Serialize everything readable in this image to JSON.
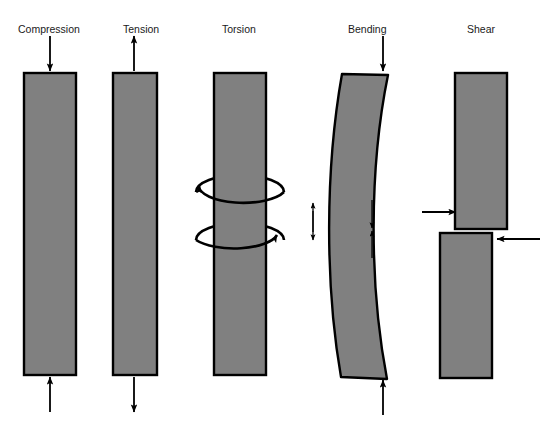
{
  "figure": {
    "background_color": "#ffffff",
    "member_fill_color": "#808080",
    "member_stroke_color": "#000000",
    "arrow_color": "#000000",
    "label_color": "#1a1a1a"
  },
  "labels": {
    "compression": "Compression",
    "tension": "Tension",
    "torsion": "Torsion",
    "bending": "Bending",
    "shear": "Shear"
  },
  "panels": [
    {
      "id": "compression",
      "label": "Compression",
      "label_x": 18,
      "label_y": 33,
      "load_description": "Two collinear arrows pointing toward the bar from top and bottom",
      "arrows": [
        {
          "name": "top-arrow",
          "direction": "down",
          "x": 50,
          "y1": 36,
          "y2": 71
        },
        {
          "name": "bottom-arrow",
          "direction": "up",
          "x": 50,
          "y1": 412,
          "y2": 377
        }
      ],
      "member": {
        "shape": "rectangle",
        "x": 24,
        "y": 73,
        "width": 52,
        "height": 302
      }
    },
    {
      "id": "tension",
      "label": "Tension",
      "label_x": 123,
      "label_y": 33,
      "load_description": "Two collinear arrows pointing away from the bar at top and bottom",
      "arrows": [
        {
          "name": "top-arrow",
          "direction": "up",
          "x": 134,
          "y1": 71,
          "y2": 36
        },
        {
          "name": "bottom-arrow",
          "direction": "down",
          "x": 134,
          "y1": 377,
          "y2": 412
        }
      ],
      "member": {
        "shape": "rectangle",
        "x": 113,
        "y": 73,
        "width": 44,
        "height": 302
      }
    },
    {
      "id": "torsion",
      "label": "Torsion",
      "label_x": 222,
      "label_y": 33,
      "load_description": "Two elliptical curved arrows encircling the bar in opposite rotational senses",
      "arrows": [
        {
          "name": "upper-twist-arrow",
          "type": "curved-ellipse",
          "cx": 240,
          "cy": 192,
          "rx": 45,
          "ry": 17,
          "arrowhead": "upper-left"
        },
        {
          "name": "lower-twist-arrow",
          "type": "curved-ellipse",
          "cx": 240,
          "cy": 240,
          "rx": 45,
          "ry": 17,
          "arrowhead": "right"
        }
      ],
      "member": {
        "shape": "rectangle",
        "x": 214,
        "y": 73,
        "width": 52,
        "height": 302
      }
    },
    {
      "id": "bending",
      "label": "Bending",
      "label_x": 348,
      "label_y": 33,
      "load_description": "Curved beam bowed to the left with end loads and internal compression/tension arrow pairs",
      "arrows": [
        {
          "name": "top-arrow",
          "direction": "down",
          "x": 383,
          "y1": 36,
          "y2": 71
        },
        {
          "name": "bottom-arrow",
          "direction": "up",
          "x": 383,
          "y1": 415,
          "y2": 380
        },
        {
          "name": "left-upper-arrow",
          "direction": "up",
          "x": 313,
          "y1": 232,
          "y2": 202
        },
        {
          "name": "left-lower-arrow",
          "direction": "down",
          "x": 313,
          "y1": 210,
          "y2": 240
        },
        {
          "name": "right-upper-arrow",
          "direction": "down",
          "x": 372,
          "y1": 200,
          "y2": 228
        },
        {
          "name": "right-lower-arrow",
          "direction": "up",
          "x": 372,
          "y1": 258,
          "y2": 230
        }
      ],
      "member": {
        "shape": "curved-beam",
        "bow": "left",
        "top_y": 73,
        "bottom_y": 378
      }
    },
    {
      "id": "shear",
      "label": "Shear",
      "label_x": 467,
      "label_y": 33,
      "load_description": "Two offset blocks pushed in opposite horizontal directions along the split plane",
      "arrows": [
        {
          "name": "upper-left-arrow",
          "direction": "right",
          "y": 212,
          "x1": 422,
          "x2": 456
        },
        {
          "name": "lower-right-arrow",
          "direction": "left",
          "y": 239,
          "x1": 540,
          "x2": 497
        }
      ],
      "member": {
        "shape": "split-blocks",
        "upper_block": {
          "x": 455,
          "y": 73,
          "width": 52,
          "height": 156
        },
        "lower_block": {
          "x": 440,
          "y": 233,
          "width": 52,
          "height": 145
        }
      }
    }
  ]
}
